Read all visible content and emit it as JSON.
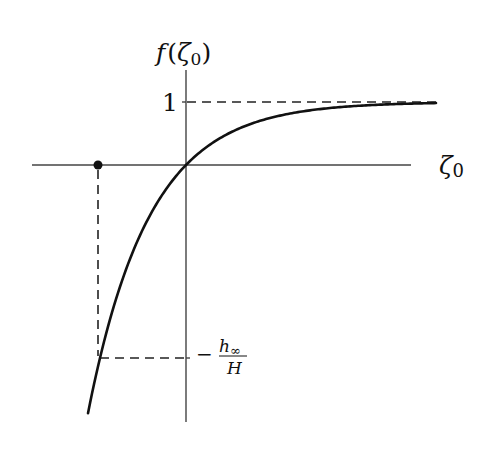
{
  "diagram": {
    "y_axis_label": "f(ζ₀)",
    "y_axis_label_parts": {
      "f": "f",
      "open": "(",
      "zeta": "ζ",
      "sub": "0",
      "close": ")"
    },
    "x_axis_label_parts": {
      "zeta": "ζ",
      "sub": "0"
    },
    "tick_one_label": "1",
    "neg_label_parts": {
      "minus": "−",
      "numerator": "h",
      "num_sub": "∞",
      "denominator": "H"
    },
    "curve": "f(ζ₀) = 1 − exp(−k ζ₀), asymptote f=1",
    "marked_point": "filled dot on ζ₀ axis, dashed drop to curve at f = −h∞/H",
    "colors": {
      "line": "#111111",
      "axis": "#444444",
      "background": "#ffffff"
    }
  },
  "chart_data": {
    "type": "line",
    "title": "",
    "xlabel": "ζ₀",
    "ylabel": "f(ζ₀)",
    "y_ticks": [
      {
        "value": 1,
        "label": "1"
      },
      {
        "value": -3.06,
        "label": "−h∞/H"
      }
    ],
    "asymptote": 1,
    "series": [
      {
        "name": "f(ζ₀)",
        "shape": "1 - exp(-k ζ₀)",
        "passes_through_origin": true
      }
    ],
    "annotations": [
      "dashed line y=1",
      "dashed vertical from dot at ζ₀<0 down to curve",
      "dashed horizontal at y=−h∞/H to vertical axis"
    ]
  }
}
